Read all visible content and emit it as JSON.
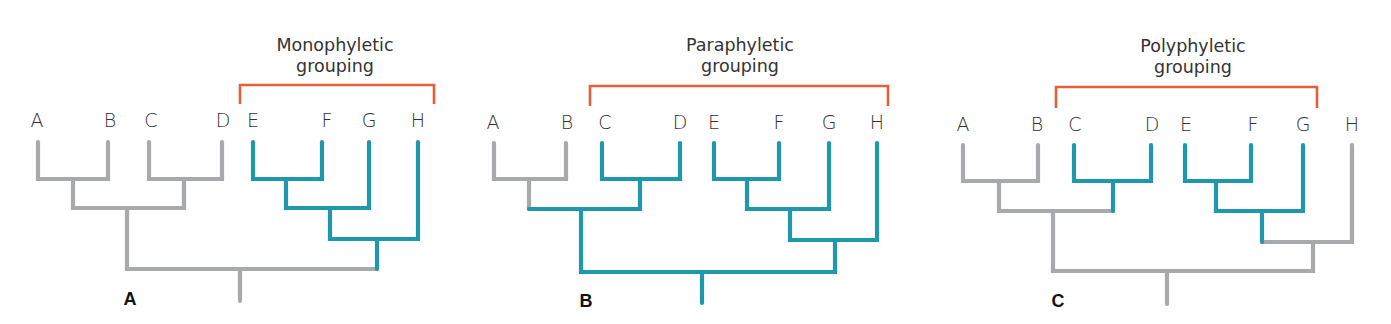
{
  "colors": {
    "ancestral": "#a7a9ac",
    "grouped": "#1f97ac",
    "bracket": "#e65f3b",
    "text": "#333333"
  },
  "panels": [
    {
      "id": "A",
      "panel_label": "A",
      "title_lines": [
        "Monophyletic",
        "grouping"
      ],
      "leaves": [
        "A",
        "B",
        "C",
        "D",
        "E",
        "F",
        "G",
        "H"
      ],
      "grouped_taxa": [
        "E",
        "F",
        "G",
        "H"
      ]
    },
    {
      "id": "B",
      "panel_label": "B",
      "title_lines": [
        "Paraphyletic",
        "grouping"
      ],
      "leaves": [
        "A",
        "B",
        "C",
        "D",
        "E",
        "F",
        "G",
        "H"
      ],
      "grouped_taxa": [
        "C",
        "D",
        "E",
        "F",
        "G",
        "H"
      ]
    },
    {
      "id": "C",
      "panel_label": "C",
      "title_lines": [
        "Polyphyletic",
        "grouping"
      ],
      "leaves": [
        "A",
        "B",
        "C",
        "D",
        "E",
        "F",
        "G",
        "H"
      ],
      "grouped_taxa": [
        "C",
        "D",
        "E",
        "F",
        "G"
      ]
    }
  ]
}
